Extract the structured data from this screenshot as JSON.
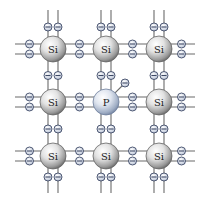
{
  "diagram": {
    "colors": {
      "background": "#ffffff",
      "bond_line": "#6b6b6b",
      "si_atom_light": "#f4f4f4",
      "si_atom_dark": "#7a7a7a",
      "p_atom_light": "#eef2f8",
      "p_atom_dark": "#8a9ab4",
      "electron_fill": "#dde3ee",
      "electron_stroke": "#3e4a66",
      "label": "#222222"
    },
    "grid": {
      "columns_x": [
        53,
        106,
        159
      ],
      "rows_y": [
        49,
        102,
        156
      ],
      "atom_radius": 13,
      "bond_offset": 5,
      "electron_radius": 4,
      "extent": {
        "left": 15,
        "right": 195,
        "top": 10,
        "bottom": 193
      }
    },
    "atoms": [
      {
        "row": 0,
        "col": 0,
        "label": "Si",
        "type": "si"
      },
      {
        "row": 0,
        "col": 1,
        "label": "Si",
        "type": "si"
      },
      {
        "row": 0,
        "col": 2,
        "label": "Si",
        "type": "si"
      },
      {
        "row": 1,
        "col": 0,
        "label": "Si",
        "type": "si"
      },
      {
        "row": 1,
        "col": 1,
        "label": "P",
        "type": "p"
      },
      {
        "row": 1,
        "col": 2,
        "label": "Si",
        "type": "si"
      },
      {
        "row": 2,
        "col": 0,
        "label": "Si",
        "type": "si"
      },
      {
        "row": 2,
        "col": 1,
        "label": "Si",
        "type": "si"
      },
      {
        "row": 2,
        "col": 2,
        "label": "Si",
        "type": "si"
      }
    ],
    "free_electron": {
      "from_atom": "P",
      "dx": 19,
      "dy": -19,
      "label": "−"
    },
    "electron_symbol": "−"
  }
}
